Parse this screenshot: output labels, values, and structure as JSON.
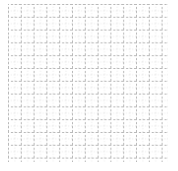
{
  "canvas": {
    "width": 178,
    "height": 171,
    "background_color": "#ffffff"
  },
  "grid": {
    "label": "dotted graph-paper grid",
    "origin_x": 8,
    "origin_y": 4,
    "width": 160,
    "height": 158,
    "minor_spacing": 6.4,
    "major_spacing": 12.8,
    "minor_color": "#e6e6e6",
    "major_color": "#b8b8b8",
    "minor_line_width": 1,
    "major_line_width": 1,
    "minor_dash": "1 2",
    "major_dash": "2 2",
    "minor_columns": 25,
    "minor_rows": 25,
    "major_columns": 13,
    "major_rows": 13,
    "border_visible": false
  },
  "chart_data": {
    "type": "table",
    "title": "",
    "subtitle": "",
    "xlabel": "",
    "ylabel": "",
    "categories": [],
    "values": [],
    "series": [],
    "tick_labels_x": [],
    "tick_labels_y": [],
    "legend": [],
    "annotations": [],
    "grid": "on",
    "legend_position": "none",
    "note": "Empty dotted grid / graph paper background with no plotted data, axes labels, or annotations."
  }
}
